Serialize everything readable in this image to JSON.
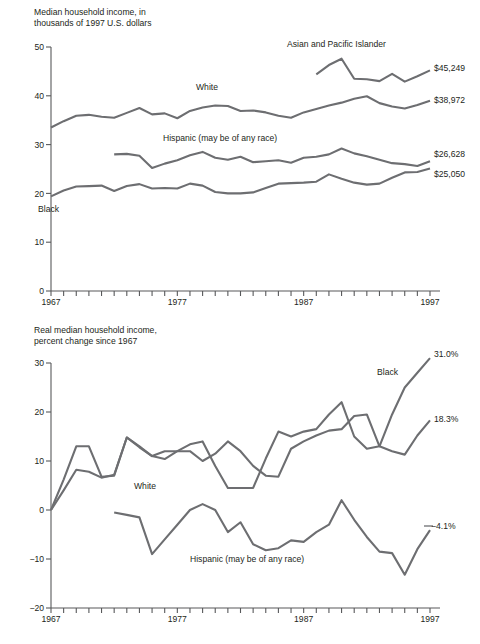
{
  "page": {
    "background": "#ffffff",
    "line_color": "#6d6e71",
    "axis_color": "#58595b",
    "text_color": "#231f20"
  },
  "chart_data": [
    {
      "id": "top",
      "type": "line",
      "title": "Median household income, in thousands of 1997 U.S. dollars",
      "title_line1": "Median household income, in",
      "title_line2": "thousands of 1997 U.S. dollars",
      "xlabel": "",
      "ylabel": "",
      "xlim": [
        1967,
        1997
      ],
      "ylim": [
        0,
        50
      ],
      "yticks": [
        0,
        10,
        20,
        30,
        40,
        50
      ],
      "ytick_labels": [
        "0",
        "10",
        "20",
        "30",
        "40",
        "50"
      ],
      "xticks": [
        1967,
        1977,
        1987,
        1997
      ],
      "xtick_labels": [
        "1967",
        "1977",
        "1987",
        "1997"
      ],
      "minor_xticks_every": 1,
      "grid": false,
      "legend_position": "inline-annotations",
      "x": [
        1967,
        1968,
        1969,
        1970,
        1971,
        1972,
        1973,
        1974,
        1975,
        1976,
        1977,
        1978,
        1979,
        1980,
        1981,
        1982,
        1983,
        1984,
        1985,
        1986,
        1987,
        1988,
        1989,
        1990,
        1991,
        1992,
        1993,
        1994,
        1995,
        1996,
        1997
      ],
      "series": [
        {
          "name": "Asian and Pacific Islander",
          "label": "Asian and Pacific Islander",
          "end_value_label": "$45,249",
          "start_year": 1988,
          "values": [
            null,
            null,
            null,
            null,
            null,
            null,
            null,
            null,
            null,
            null,
            null,
            null,
            null,
            null,
            null,
            null,
            null,
            null,
            null,
            null,
            null,
            44.4,
            46.3,
            47.6,
            43.5,
            43.4,
            43.0,
            44.5,
            42.9,
            44.0,
            45.2
          ]
        },
        {
          "name": "White",
          "label": "White",
          "end_value_label": "$38,972",
          "start_year": 1967,
          "values": [
            33.5,
            34.8,
            35.9,
            36.1,
            35.7,
            35.5,
            36.5,
            37.5,
            36.2,
            36.4,
            35.4,
            36.9,
            37.6,
            38.0,
            37.9,
            36.9,
            37.0,
            36.6,
            35.9,
            35.5,
            36.6,
            37.3,
            38.0,
            38.6,
            39.4,
            39.9,
            38.5,
            37.8,
            37.4,
            38.1,
            39.0
          ]
        },
        {
          "name": "Hispanic (may be of any race)",
          "label": "Hispanic (may be of any race)",
          "end_value_label": "$26,628",
          "start_year": 1972,
          "values": [
            null,
            null,
            null,
            null,
            null,
            28.0,
            28.1,
            27.7,
            25.2,
            26.1,
            26.8,
            27.8,
            28.5,
            27.3,
            26.9,
            27.5,
            26.4,
            26.6,
            26.8,
            26.3,
            27.3,
            27.5,
            28.0,
            29.2,
            28.2,
            27.6,
            26.9,
            26.2,
            26.0,
            25.6,
            26.6
          ]
        },
        {
          "name": "Black",
          "label": "Black",
          "end_value_label": "$25,050",
          "start_year": 1967,
          "values": [
            19.4,
            20.6,
            21.4,
            21.5,
            21.6,
            20.5,
            21.5,
            21.9,
            21.0,
            21.1,
            21.0,
            22.0,
            21.6,
            20.3,
            20.0,
            20.0,
            20.2,
            21.1,
            22.0,
            22.1,
            22.2,
            22.4,
            23.9,
            23.0,
            22.2,
            21.8,
            22.0,
            23.2,
            24.3,
            24.4,
            25.1
          ]
        }
      ]
    },
    {
      "id": "bottom",
      "type": "line",
      "title": "Real median household income, percent change since 1967",
      "title_line1": "Real median household income,",
      "title_line2": "percent change since 1967",
      "xlabel": "",
      "ylabel": "",
      "xlim": [
        1967,
        1997
      ],
      "ylim": [
        -20,
        30
      ],
      "yticks": [
        -20,
        -10,
        0,
        10,
        20,
        30
      ],
      "ytick_labels": [
        "−20",
        "−10",
        "0",
        "10",
        "20",
        "30"
      ],
      "xticks": [
        1967,
        1977,
        1987,
        1997
      ],
      "xtick_labels": [
        "1967",
        "1977",
        "1987",
        "1997"
      ],
      "minor_xticks_every": 1,
      "grid": false,
      "legend_position": "inline-annotations",
      "x": [
        1967,
        1968,
        1969,
        1970,
        1971,
        1972,
        1973,
        1974,
        1975,
        1976,
        1977,
        1978,
        1979,
        1980,
        1981,
        1982,
        1983,
        1984,
        1985,
        1986,
        1987,
        1988,
        1989,
        1990,
        1991,
        1992,
        1993,
        1994,
        1995,
        1996,
        1997
      ],
      "series": [
        {
          "name": "Black",
          "label": "Black",
          "end_value_label": "31.0%",
          "start_year": 1967,
          "values": [
            0.0,
            6.2,
            13.0,
            13.0,
            6.8,
            7.0,
            14.8,
            12.8,
            11.0,
            12.0,
            12.0,
            13.4,
            14.0,
            9.0,
            4.5,
            4.5,
            4.5,
            10.5,
            16.0,
            15.0,
            16.0,
            16.5,
            19.5,
            22.0,
            15.0,
            12.5,
            13.0,
            19.5,
            25.0,
            28.0,
            31.0
          ]
        },
        {
          "name": "White",
          "label": "White",
          "end_value_label": "18.3%",
          "start_year": 1967,
          "values": [
            0.0,
            4.0,
            8.2,
            7.8,
            6.6,
            7.2,
            14.8,
            13.0,
            11.0,
            10.4,
            12.0,
            12.0,
            10.0,
            11.5,
            14.0,
            12.0,
            9.0,
            7.0,
            6.8,
            12.5,
            14.0,
            15.2,
            16.2,
            16.5,
            19.2,
            19.5,
            13.0,
            12.0,
            11.3,
            15.2,
            18.3
          ]
        },
        {
          "name": "Hispanic (may be of any race)",
          "label": "Hispanic (may be of any race)",
          "end_value_label": "−4.1%",
          "start_year": 1972,
          "values": [
            null,
            null,
            null,
            null,
            null,
            -0.5,
            -1.0,
            -1.5,
            -9.0,
            -6.0,
            -3.0,
            0.0,
            1.2,
            0.0,
            -4.5,
            -2.5,
            -7.0,
            -8.2,
            -7.8,
            -6.2,
            -6.5,
            -4.5,
            -3.0,
            2.0,
            -2.0,
            -5.5,
            -8.5,
            -8.8,
            -13.2,
            -8.0,
            -4.1
          ]
        }
      ]
    }
  ]
}
